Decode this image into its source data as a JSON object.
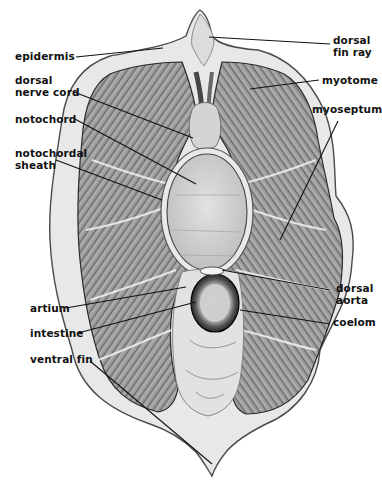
{
  "figure": {
    "colors": {
      "background": "#ffffff",
      "outline": "#555555",
      "skin": "#e6e6e6",
      "muscle": "#8a8a8a",
      "muscle_dark": "#3a3a3a",
      "notochord": "#cfcfcf",
      "intestine_wall": "#1a1a1a",
      "leader_line": "#111111"
    }
  },
  "labels": {
    "epidermis": "epidermis",
    "dorsal_nerve_cord": "dorsal\nnerve cord",
    "notochord": "notochord",
    "notochordal_sheath": "notochordal\nsheath",
    "artium": "artium",
    "intestine": "intestine",
    "ventral_fin": "ventral fin",
    "dorsal_fin_ray": "dorsal\nfin ray",
    "myotome": "myotome",
    "myoseptum": "myoseptum",
    "dorsal_aorta": "dorsal\naorta",
    "coelom": "coelom"
  }
}
